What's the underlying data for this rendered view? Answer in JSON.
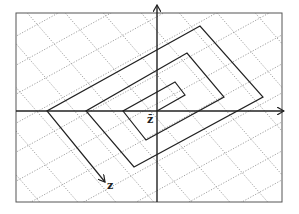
{
  "diagram": {
    "frame": {
      "x": 16,
      "y": 13,
      "width": 266,
      "height": 189
    },
    "axes": {
      "origin": [
        157,
        111
      ],
      "vertical_arrow_top": [
        157,
        5
      ],
      "horizontal_arrow_right": [
        284,
        111
      ]
    },
    "spiral_points": [
      [
        157,
        111
      ],
      [
        185,
        95
      ],
      [
        175,
        82
      ],
      [
        123,
        111
      ],
      [
        146,
        140
      ],
      [
        224,
        97
      ],
      [
        187,
        53
      ],
      [
        86,
        111
      ],
      [
        134,
        167
      ],
      [
        263,
        97
      ],
      [
        200,
        26
      ],
      [
        47,
        111
      ],
      [
        105,
        182
      ]
    ],
    "labels": {
      "z_bar": "z̄",
      "z_end": "z"
    },
    "colors": {
      "line": "#222222",
      "grid": "#888888",
      "frame": "#555555"
    }
  }
}
